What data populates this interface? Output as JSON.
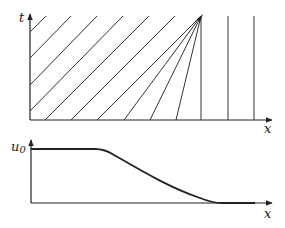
{
  "top_panel": {
    "y_axis_label": "t",
    "x_axis_label": "x",
    "description": "Characteristics in the x-t plane: parallel diagonal lines on the left, a rarefaction fan converging at an apex, and vertical lines on the right",
    "apex": [
      201,
      16
    ],
    "parallel_lines": [
      [
        [
          30,
          32
        ],
        [
          46,
          16
        ]
      ],
      [
        [
          30,
          58
        ],
        [
          71,
          16
        ]
      ],
      [
        [
          30,
          85
        ],
        [
          97,
          16
        ]
      ],
      [
        [
          30,
          111
        ],
        [
          123,
          16
        ]
      ],
      [
        [
          44,
          120
        ],
        [
          148,
          16
        ]
      ],
      [
        [
          71,
          120
        ],
        [
          174,
          16
        ]
      ]
    ],
    "fan_lines_from_x": [
      97,
      124,
      150,
      176
    ],
    "vertical_lines_x": [
      201,
      228,
      254
    ]
  },
  "bottom_panel": {
    "y_axis_label": "u",
    "y_axis_subscript": "0",
    "x_axis_label": "x",
    "description": "Initial profile u0(x): high constant on left, smooth decrease to zero on right"
  },
  "colors": {
    "ink": "#222222",
    "background": "#ffffff"
  }
}
